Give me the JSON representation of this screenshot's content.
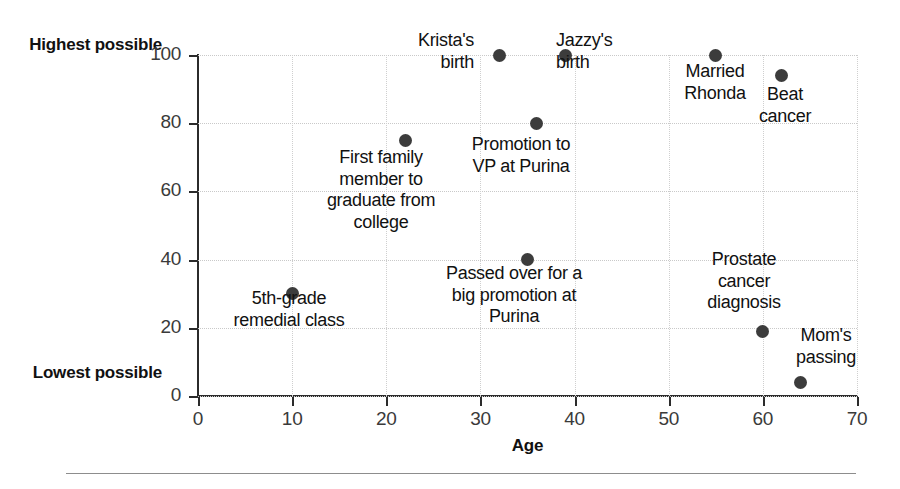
{
  "chart_data": {
    "type": "scatter",
    "title": "",
    "subtitle": "",
    "xlabel": "Age",
    "ylabel": "",
    "xlim": [
      0,
      70
    ],
    "ylim": [
      0,
      100
    ],
    "xticks": [
      0,
      10,
      20,
      30,
      40,
      50,
      60,
      70
    ],
    "yticks": [
      0,
      20,
      40,
      60,
      80,
      100
    ],
    "y_axis_end_labels": {
      "high": "Highest\npossible",
      "low": "Lowest\npossible"
    },
    "grid": true,
    "legend": "none",
    "point_color": "#3c3c3c",
    "points": [
      {
        "label": "5th-grade\nremedial class",
        "x": 10,
        "y": 30
      },
      {
        "label": "First family\nmember to\ngraduate from\ncollege",
        "x": 22,
        "y": 75
      },
      {
        "label": "Krista's\nbirth",
        "x": 32,
        "y": 100
      },
      {
        "label": "Passed over for a\nbig promotion at\nPurina",
        "x": 35,
        "y": 40
      },
      {
        "label": "Promotion to\nVP at Purina",
        "x": 36,
        "y": 80
      },
      {
        "label": "Jazzy's\nbirth",
        "x": 39,
        "y": 100
      },
      {
        "label": "Married\nRhonda",
        "x": 55,
        "y": 100
      },
      {
        "label": "Prostate\ncancer\ndiagnosis",
        "x": 60,
        "y": 19
      },
      {
        "label": "Beat\ncancer",
        "x": 62,
        "y": 94
      },
      {
        "label": "Mom's\npassing",
        "x": 64,
        "y": 4
      }
    ]
  },
  "annotations": [
    {
      "text": "Krista's\nbirth",
      "left": 474,
      "top": 30,
      "align": "right"
    },
    {
      "text": "Jazzy's\nbirth",
      "left": 556,
      "top": 30,
      "align": "left"
    },
    {
      "text": "Married\nRhonda",
      "left": 715,
      "top": 61,
      "align": "ctr"
    },
    {
      "text": "Beat\ncancer",
      "left": 785,
      "top": 84,
      "align": "ctr"
    },
    {
      "text": "Promotion to\nVP at Purina",
      "left": 521,
      "top": 134,
      "align": "ctr"
    },
    {
      "text": "First family\nmember to\ngraduate from\ncollege",
      "left": 381,
      "top": 147,
      "align": "ctr"
    },
    {
      "text": "Passed over for a\nbig promotion at\nPurina",
      "left": 514,
      "top": 263,
      "align": "ctr"
    },
    {
      "text": "Prostate\ncancer\ndiagnosis",
      "left": 744,
      "top": 249,
      "align": "ctr"
    },
    {
      "text": "5th-grade\nremedial class",
      "left": 289,
      "top": 288,
      "align": "ctr"
    },
    {
      "text": "Mom's\npassing",
      "left": 826,
      "top": 325,
      "align": "ctr"
    }
  ]
}
